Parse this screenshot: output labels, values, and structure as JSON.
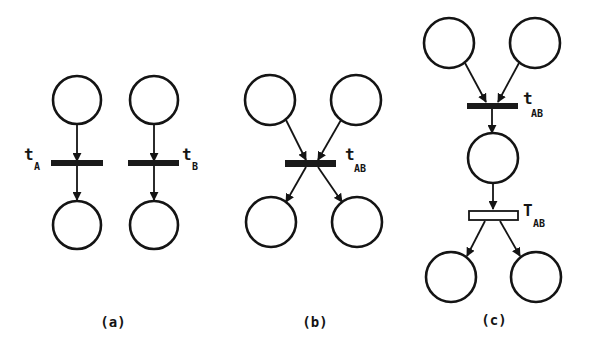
{
  "diagram": {
    "type": "petri-net",
    "panels": [
      {
        "id": "a",
        "caption": "(a)",
        "transitions": [
          {
            "id": "t_A",
            "main": "t",
            "sub": "A",
            "style": "solid"
          },
          {
            "id": "t_B",
            "main": "t",
            "sub": "B",
            "style": "solid"
          }
        ],
        "places": 4
      },
      {
        "id": "b",
        "caption": "(b)",
        "transitions": [
          {
            "id": "t_AB",
            "main": "t",
            "sub": "AB",
            "style": "solid"
          }
        ],
        "places": 4
      },
      {
        "id": "c",
        "caption": "(c)",
        "transitions": [
          {
            "id": "t_AB",
            "main": "t",
            "sub": "AB",
            "style": "solid"
          },
          {
            "id": "T_AB",
            "main": "T",
            "sub": "AB",
            "style": "hollow"
          }
        ],
        "places": 5
      }
    ]
  },
  "colors": {
    "stroke": "#141414",
    "background": "#ffffff"
  }
}
